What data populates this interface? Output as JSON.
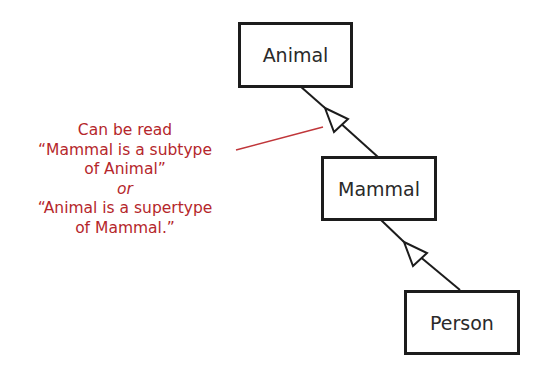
{
  "diagram": {
    "type": "uml-generalization-hierarchy",
    "classes": [
      {
        "id": "animal",
        "label": "Animal"
      },
      {
        "id": "mammal",
        "label": "Mammal"
      },
      {
        "id": "person",
        "label": "Person"
      }
    ],
    "relationships": [
      {
        "from": "mammal",
        "to": "animal",
        "kind": "generalization"
      },
      {
        "from": "person",
        "to": "mammal",
        "kind": "generalization"
      }
    ],
    "annotation": {
      "lines": [
        "Can be read",
        "“Mammal is a subtype",
        "of Animal”",
        "or",
        "“Animal is a supertype",
        "of Mammal.”"
      ],
      "target": "mammal-to-animal-generalization"
    },
    "colors": {
      "box_border": "#1c1c1c",
      "text": "#2a2a2a",
      "annotation": "#b5262b"
    }
  }
}
